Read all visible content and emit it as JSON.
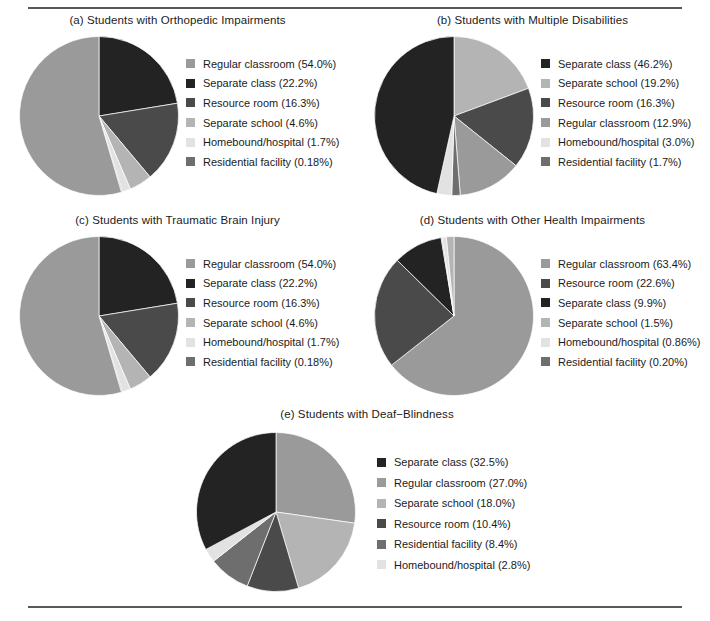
{
  "figure": {
    "background": "#ffffff",
    "rule_color": "#58585a",
    "text_color": "#1b1b1b"
  },
  "palette": {
    "regular_classroom": "#9a9a9a",
    "separate_class": "#232323",
    "resource_room": "#4a4a4a",
    "separate_school": "#b4b4b4",
    "homebound_hospital": "#e2e2e2",
    "residential_facility": "#6e6e6e"
  },
  "chart_data": [
    {
      "id": "a",
      "type": "pie",
      "title": "(a) Students with Orthopedic Impairments",
      "start_angle_deg": 0,
      "direction": "clockwise",
      "legend_position": "right",
      "categories": [
        "Regular classroom",
        "Separate class",
        "Resource room",
        "Separate school",
        "Homebound/hospital",
        "Residential facility"
      ],
      "values": [
        54.0,
        22.2,
        16.3,
        4.6,
        1.7,
        0.18
      ],
      "labels": [
        "Regular classroom (54.0%)",
        "Separate class (22.2%)",
        "Resource room (16.3%)",
        "Separate school (4.6%)",
        "Homebound/hospital (1.7%)",
        "Residential facility (0.18%)"
      ],
      "colors": [
        "#9a9a9a",
        "#232323",
        "#4a4a4a",
        "#b4b4b4",
        "#e2e2e2",
        "#6e6e6e"
      ],
      "slice_order": [
        1,
        2,
        3,
        4,
        5,
        0
      ]
    },
    {
      "id": "b",
      "type": "pie",
      "title": "(b) Students with Multiple Disabilities",
      "start_angle_deg": 0,
      "direction": "clockwise",
      "legend_position": "right",
      "categories": [
        "Separate class",
        "Separate school",
        "Resource room",
        "Regular classroom",
        "Homebound/hospital",
        "Residential facility"
      ],
      "values": [
        46.2,
        19.2,
        16.3,
        12.9,
        3.0,
        1.7
      ],
      "labels": [
        "Separate class (46.2%)",
        "Separate school (19.2%)",
        "Resource room (16.3%)",
        "Regular classroom (12.9%)",
        "Homebound/hospital (3.0%)",
        "Residential facility (1.7%)"
      ],
      "colors": [
        "#232323",
        "#b4b4b4",
        "#4a4a4a",
        "#9a9a9a",
        "#e2e2e2",
        "#6e6e6e"
      ],
      "slice_order": [
        1,
        2,
        3,
        5,
        4,
        0
      ]
    },
    {
      "id": "c",
      "type": "pie",
      "title": "(c) Students with Traumatic Brain Injury",
      "start_angle_deg": 0,
      "direction": "clockwise",
      "legend_position": "right",
      "categories": [
        "Regular classroom",
        "Separate class",
        "Resource room",
        "Separate school",
        "Homebound/hospital",
        "Residential facility"
      ],
      "values": [
        54.0,
        22.2,
        16.3,
        4.6,
        1.7,
        0.18
      ],
      "labels": [
        "Regular classroom (54.0%)",
        "Separate class (22.2%)",
        "Resource room (16.3%)",
        "Separate school (4.6%)",
        "Homebound/hospital (1.7%)",
        "Residential facility (0.18%)"
      ],
      "colors": [
        "#9a9a9a",
        "#232323",
        "#4a4a4a",
        "#b4b4b4",
        "#e2e2e2",
        "#6e6e6e"
      ],
      "slice_order": [
        1,
        2,
        3,
        4,
        5,
        0
      ]
    },
    {
      "id": "d",
      "type": "pie",
      "title": "(d) Students with Other Health Impairments",
      "start_angle_deg": 0,
      "direction": "clockwise",
      "legend_position": "right",
      "categories": [
        "Regular classroom",
        "Resource room",
        "Separate class",
        "Separate school",
        "Homebound/hospital",
        "Residential facility"
      ],
      "values": [
        63.4,
        22.6,
        9.9,
        1.5,
        0.86,
        0.2
      ],
      "labels": [
        "Regular classroom (63.4%)",
        "Resource room (22.6%)",
        "Separate class (9.9%)",
        "Separate school (1.5%)",
        "Homebound/hospital (0.86%)",
        "Residential facility (0.20%)"
      ],
      "colors": [
        "#9a9a9a",
        "#4a4a4a",
        "#232323",
        "#b4b4b4",
        "#e2e2e2",
        "#6e6e6e"
      ],
      "slice_order": [
        0,
        1,
        2,
        5,
        4,
        3
      ]
    },
    {
      "id": "e",
      "type": "pie",
      "title": "(e) Students with Deaf−Blindness",
      "start_angle_deg": 0,
      "direction": "clockwise",
      "legend_position": "right",
      "categories": [
        "Separate class",
        "Regular classroom",
        "Separate school",
        "Resource room",
        "Residential facility",
        "Homebound/hospital"
      ],
      "values": [
        32.5,
        27.0,
        18.0,
        10.4,
        8.4,
        2.8
      ],
      "labels": [
        "Separate class (32.5%)",
        "Regular classroom (27.0%)",
        "Separate school (18.0%)",
        "Resource room (10.4%)",
        "Residential facility (8.4%)",
        "Homebound/hospital (2.8%)"
      ],
      "colors": [
        "#232323",
        "#9a9a9a",
        "#b4b4b4",
        "#4a4a4a",
        "#6e6e6e",
        "#e2e2e2"
      ],
      "slice_order": [
        1,
        2,
        3,
        4,
        5,
        0
      ]
    }
  ]
}
